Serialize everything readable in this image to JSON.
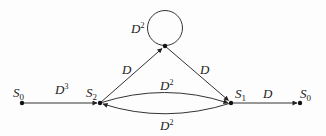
{
  "diagram": {
    "type": "state-transition-graph",
    "nodes": [
      {
        "id": "s0_left",
        "label": "S",
        "sub": "0",
        "x": 22,
        "y": 103
      },
      {
        "id": "s2",
        "label": "S",
        "sub": "2",
        "x": 100,
        "y": 103
      },
      {
        "id": "top",
        "label": "",
        "sub": "",
        "x": 165,
        "y": 46
      },
      {
        "id": "s1",
        "label": "S",
        "sub": "1",
        "x": 231,
        "y": 103
      },
      {
        "id": "s0_right",
        "label": "S",
        "sub": "0",
        "x": 300,
        "y": 103
      }
    ],
    "edges": [
      {
        "from": "s0_left",
        "to": "s2",
        "label": "D",
        "exp": "3"
      },
      {
        "from": "s2",
        "to": "top",
        "label": "D",
        "exp": ""
      },
      {
        "from": "top",
        "to": "top",
        "label": "D",
        "exp": "2",
        "kind": "self-loop"
      },
      {
        "from": "top",
        "to": "s1",
        "label": "D",
        "exp": ""
      },
      {
        "from": "s2",
        "to": "s1",
        "label": "D",
        "exp": "2",
        "kind": "upper-arc"
      },
      {
        "from": "s1",
        "to": "s2",
        "label": "D",
        "exp": "2",
        "kind": "lower-arc"
      },
      {
        "from": "s1",
        "to": "s0_right",
        "label": "D",
        "exp": ""
      }
    ],
    "colors": {
      "line": "#333333",
      "node": "#111111",
      "text": "#222222"
    }
  },
  "labels": {
    "s0_left": {
      "base": "S",
      "sub": "0"
    },
    "s2": {
      "base": "S",
      "sub": "2"
    },
    "s1": {
      "base": "S",
      "sub": "1"
    },
    "s0_right": {
      "base": "S",
      "sub": "0"
    },
    "edge_s0_s2": {
      "base": "D",
      "sup": "3"
    },
    "edge_s2_top": {
      "base": "D"
    },
    "edge_loop": {
      "base": "D",
      "sup": "2"
    },
    "edge_top_s1": {
      "base": "D"
    },
    "edge_upper": {
      "base": "D",
      "sup": "2"
    },
    "edge_lower": {
      "base": "D",
      "sup": "2"
    },
    "edge_s1_s0": {
      "base": "D"
    }
  }
}
